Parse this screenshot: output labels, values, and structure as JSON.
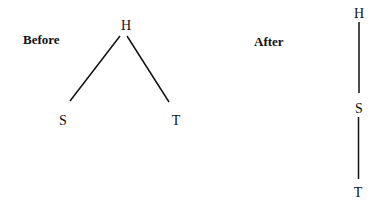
{
  "diagrams": {
    "before": {
      "title": "Before",
      "nodes": {
        "top": "H",
        "left": "S",
        "right": "T"
      },
      "edges": [
        [
          "H",
          "S"
        ],
        [
          "H",
          "T"
        ]
      ]
    },
    "after": {
      "title": "After",
      "nodes": {
        "top": "H",
        "middle": "S",
        "bottom": "T"
      },
      "edges": [
        [
          "H",
          "S"
        ],
        [
          "S",
          "T"
        ]
      ]
    }
  }
}
